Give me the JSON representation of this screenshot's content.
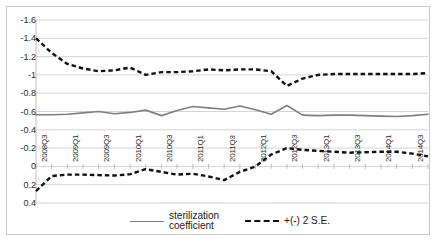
{
  "chart_data": {
    "type": "line",
    "title": "",
    "xlabel": "",
    "ylabel": "",
    "ylim": [
      0.4,
      -1.6
    ],
    "y_inverted": true,
    "grid": true,
    "legend_position": "bottom",
    "y_ticks": [
      "-1.6",
      "-1.4",
      "-1.2",
      "-1",
      "-0.8",
      "-0.6",
      "-0.4",
      "-0.2",
      "0",
      "0.2",
      "0.4"
    ],
    "y_tick_values": [
      -1.6,
      -1.4,
      -1.2,
      -1.0,
      -0.8,
      -0.6,
      -0.4,
      -0.2,
      0,
      0.2,
      0.4
    ],
    "x_tick_labels": [
      "2008Q3",
      "2009Q1",
      "2009Q3",
      "2010Q1",
      "2010Q3",
      "2011Q1",
      "2011Q3",
      "2012Q1",
      "2012Q3",
      "2013Q1",
      "2013Q3",
      "2014Q1",
      "2014Q3"
    ],
    "categories": [
      "2008Q3",
      "2008Q4",
      "2009Q1",
      "2009Q2",
      "2009Q3",
      "2009Q4",
      "2010Q1",
      "2010Q2",
      "2010Q3",
      "2010Q4",
      "2011Q1",
      "2011Q2",
      "2011Q3",
      "2011Q4",
      "2012Q1",
      "2012Q2",
      "2012Q3",
      "2012Q4",
      "2013Q1",
      "2013Q2",
      "2013Q3",
      "2013Q4",
      "2014Q1",
      "2014Q2",
      "2014Q3",
      "2014Q4"
    ],
    "series": [
      {
        "name": "sterilization coefficient",
        "style": "solid",
        "color": "#7f7f7f",
        "values": [
          -0.565,
          -0.565,
          -0.57,
          -0.585,
          -0.6,
          -0.575,
          -0.59,
          -0.615,
          -0.555,
          -0.61,
          -0.655,
          -0.64,
          -0.625,
          -0.66,
          -0.62,
          -0.57,
          -0.665,
          -0.56,
          -0.555,
          -0.56,
          -0.56,
          -0.555,
          -0.55,
          -0.545,
          -0.555,
          -0.57
        ]
      },
      {
        "name": "+(-) 2 S.E. upper",
        "style": "dashed",
        "color": "#111111",
        "values": [
          -1.4,
          -1.24,
          -1.12,
          -1.07,
          -1.04,
          -1.05,
          -1.08,
          -1.0,
          -1.03,
          -1.03,
          -1.04,
          -1.06,
          -1.05,
          -1.06,
          -1.06,
          -1.04,
          -0.88,
          -0.96,
          -1.0,
          -1.01,
          -1.01,
          -1.01,
          -1.01,
          -1.01,
          -1.01,
          -1.02
        ]
      },
      {
        "name": "+(-) 2 S.E. lower",
        "style": "dashed",
        "color": "#111111",
        "values": [
          0.27,
          0.105,
          0.09,
          0.09,
          0.095,
          0.1,
          0.085,
          0.03,
          0.06,
          0.09,
          0.08,
          0.11,
          0.15,
          0.06,
          0.0,
          -0.13,
          -0.2,
          -0.18,
          -0.17,
          -0.16,
          -0.15,
          -0.155,
          -0.16,
          -0.16,
          -0.14,
          -0.11
        ]
      }
    ],
    "legend": [
      {
        "label_line1": "sterilization",
        "label_line2": "coefficient",
        "style": "solid"
      },
      {
        "label_line1": "+(-) 2 S.E.",
        "label_line2": "",
        "style": "dashed"
      }
    ]
  },
  "colors": {
    "solid_line": "#7f7f7f",
    "dashed_line": "#111111",
    "gridline": "#d4d4d4",
    "border": "#c9c9c9",
    "text": "#2b2b2b"
  }
}
